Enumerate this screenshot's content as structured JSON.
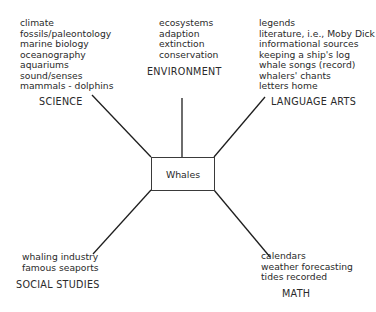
{
  "center": {
    "label": "Whales"
  },
  "branches": {
    "science": {
      "heading": "SCIENCE",
      "items": [
        "climate",
        "fossils/paleontology",
        "marine biology",
        "oceanography",
        "aquariums",
        "sound/senses",
        "mammals - dolphins"
      ]
    },
    "environment": {
      "heading": "ENVIRONMENT",
      "items": [
        "ecosystems",
        "adaption",
        "extinction",
        "conservation"
      ]
    },
    "language_arts": {
      "heading": "LANGUAGE ARTS",
      "items": [
        "legends",
        "literature, i.e., Moby Dick",
        "informational sources",
        "keeping a ship's log",
        "whale songs (record)",
        "whalers' chants",
        "letters home"
      ]
    },
    "social_studies": {
      "heading": "SOCIAL STUDIES",
      "items": [
        "whaling industry",
        "famous seaports"
      ]
    },
    "math": {
      "heading": "MATH",
      "items": [
        "calendars",
        "weather forecasting",
        "tides recorded"
      ]
    }
  },
  "colors": {
    "line": "#1e1e1e",
    "text": "#2a2a2a",
    "background": "#ffffff"
  }
}
